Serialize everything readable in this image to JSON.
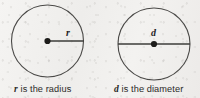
{
  "figure": {
    "background_color": "#f1f0ee",
    "stroke_color": "#4a4947",
    "text_color": "#2b2a28"
  },
  "diagrams": [
    {
      "id": "radius-diagram",
      "label": "r",
      "label_name": "radius-label",
      "caption_var": "r",
      "caption_text": " is the radius",
      "caption_full": "r is the radius",
      "segment_type": "radius",
      "circle": {
        "cx": 47.5,
        "cy": 41,
        "r": 36
      },
      "center_dot": {
        "cx": 47.5,
        "cy": 41,
        "r": 3.1
      },
      "segment": {
        "x1": 47.5,
        "y1": 41,
        "x2": 83.5,
        "y2": 41
      }
    },
    {
      "id": "diameter-diagram",
      "label": "d",
      "label_name": "diameter-label",
      "caption_var": "d",
      "caption_text": " is the diameter",
      "caption_full": "d is the diameter",
      "segment_type": "diameter",
      "circle": {
        "cx": 154,
        "cy": 44,
        "r": 36
      },
      "center_dot": {
        "cx": 154,
        "cy": 44,
        "r": 3.1
      },
      "segment": {
        "x1": 118,
        "y1": 44,
        "x2": 190,
        "y2": 44
      }
    }
  ]
}
